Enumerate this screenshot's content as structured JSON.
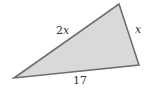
{
  "diagram": {
    "type": "triangle",
    "fill_color": "#d9d9d9",
    "stroke_color": "#6e6e6e",
    "vertices": {
      "left": [
        14,
        78
      ],
      "top": [
        119,
        4
      ],
      "right": [
        139,
        65
      ]
    },
    "sides": [
      {
        "name": "left-top",
        "label_num": "2",
        "label_var": "x"
      },
      {
        "name": "top-right",
        "label_num": "",
        "label_var": "x"
      },
      {
        "name": "bottom",
        "label_num": "17",
        "label_var": ""
      }
    ]
  }
}
